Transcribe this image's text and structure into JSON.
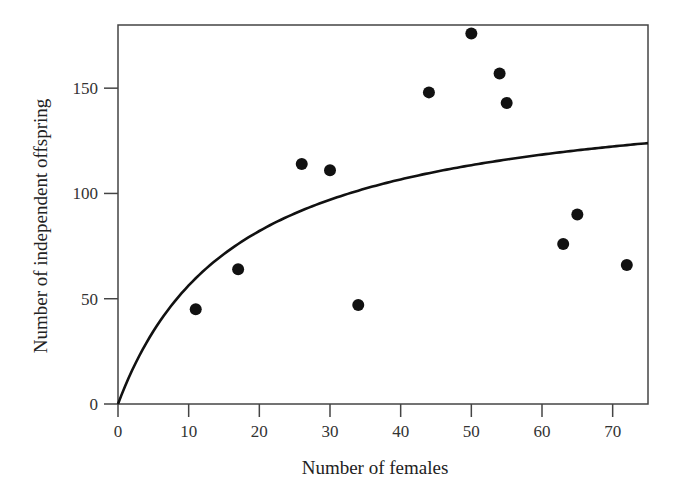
{
  "chart_data": {
    "type": "scatter",
    "title": "",
    "xlabel": "Number of females",
    "ylabel": "Number of independent offspring",
    "xlim": [
      0,
      75
    ],
    "ylim": [
      0,
      180
    ],
    "xticks": [
      0,
      10,
      20,
      30,
      40,
      50,
      60,
      70
    ],
    "yticks": [
      0,
      50,
      100,
      150
    ],
    "grid": false,
    "legend": null,
    "series": [
      {
        "name": "observed",
        "kind": "scatter",
        "color": "#111111",
        "points": [
          {
            "x": 11,
            "y": 45
          },
          {
            "x": 17,
            "y": 64
          },
          {
            "x": 26,
            "y": 114
          },
          {
            "x": 30,
            "y": 111
          },
          {
            "x": 34,
            "y": 47
          },
          {
            "x": 44,
            "y": 148
          },
          {
            "x": 50,
            "y": 176
          },
          {
            "x": 54,
            "y": 157
          },
          {
            "x": 55,
            "y": 143
          },
          {
            "x": 63,
            "y": 76
          },
          {
            "x": 65,
            "y": 90
          },
          {
            "x": 72,
            "y": 66
          }
        ]
      },
      {
        "name": "fitted curve",
        "kind": "line",
        "color": "#111111",
        "model": "y = a*x/(b+x)",
        "params": {
          "a": 152,
          "b": 17
        },
        "x_range": [
          0,
          75
        ]
      }
    ]
  }
}
